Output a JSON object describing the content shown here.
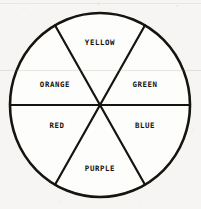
{
  "figure": {
    "name": "color-wheel",
    "shape": "circle",
    "sector_count": 6,
    "style": {
      "background_color": "#f6f5f3",
      "line_color": "#16140f",
      "text_color": "#16140f",
      "fill_color": "#fdfdfc",
      "outline_width_px": 2.6,
      "divider_width_px": 2.2
    },
    "geometry": {
      "center_x": 100,
      "center_y": 105,
      "radius_x": 90,
      "radius_y": 92,
      "divider_angles_deg": [
        0,
        60,
        120
      ]
    }
  },
  "sectors": [
    {
      "id": "sector-yellow",
      "label": "YELLOW",
      "position": "top",
      "start_angle_deg": 60,
      "end_angle_deg": 120,
      "label_x": 100,
      "label_y": 43
    },
    {
      "id": "sector-green",
      "label": "GREEN",
      "position": "upper-right",
      "start_angle_deg": 0,
      "end_angle_deg": 60,
      "label_x": 145,
      "label_y": 85
    },
    {
      "id": "sector-blue",
      "label": "BLUE",
      "position": "lower-right",
      "start_angle_deg": 300,
      "end_angle_deg": 360,
      "label_x": 145,
      "label_y": 126
    },
    {
      "id": "sector-purple",
      "label": "PURPLE",
      "position": "bottom",
      "start_angle_deg": 240,
      "end_angle_deg": 300,
      "label_x": 100,
      "label_y": 169
    },
    {
      "id": "sector-red",
      "label": "RED",
      "position": "lower-left",
      "start_angle_deg": 180,
      "end_angle_deg": 240,
      "label_x": 57,
      "label_y": 126
    },
    {
      "id": "sector-orange",
      "label": "ORANGE",
      "position": "upper-left",
      "start_angle_deg": 120,
      "end_angle_deg": 180,
      "label_x": 55,
      "label_y": 85
    }
  ]
}
